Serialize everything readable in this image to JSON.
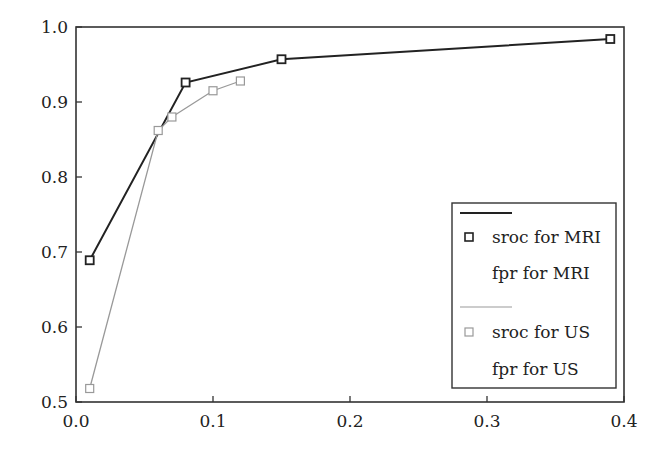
{
  "chart_data": {
    "type": "line",
    "title": "",
    "xlabel": "",
    "ylabel": "",
    "xlim": [
      0.0,
      0.4
    ],
    "ylim": [
      0.5,
      1.0
    ],
    "x_ticks": [
      "0.0",
      "0.1",
      "0.2",
      "0.3",
      "0.4"
    ],
    "y_ticks": [
      "0.5",
      "0.6",
      "0.7",
      "0.8",
      "0.9",
      "1.0"
    ],
    "grid": false,
    "legend_position": "lower right",
    "series": [
      {
        "name": "sroc for MRI",
        "color": "#222222",
        "marker": "square",
        "x": [
          0.01,
          0.08,
          0.15,
          0.39
        ],
        "y": [
          0.689,
          0.926,
          0.957,
          0.984
        ]
      },
      {
        "name": "fpr for MRI",
        "color": "#222222",
        "marker": "none",
        "x": [],
        "y": []
      },
      {
        "name": "sroc for US",
        "color": "#999999",
        "marker": "square",
        "x": [
          0.01,
          0.06,
          0.07,
          0.1,
          0.12
        ],
        "y": [
          0.518,
          0.862,
          0.88,
          0.915,
          0.928
        ]
      },
      {
        "name": "fpr for US",
        "color": "#999999",
        "marker": "none",
        "x": [],
        "y": []
      }
    ]
  },
  "legend": {
    "items": [
      "sroc for MRI",
      "fpr for MRI",
      "sroc for US",
      "fpr for US"
    ]
  }
}
